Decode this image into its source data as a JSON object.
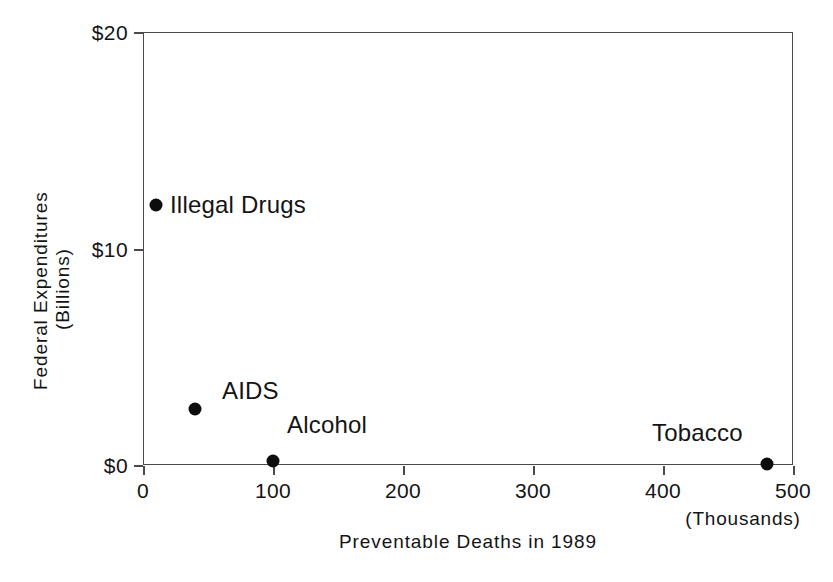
{
  "chart_data": {
    "type": "scatter",
    "title": "",
    "xlabel": "Preventable Deaths in 1989",
    "xunits": "(Thousands)",
    "ylabel": "Federal Expenditures",
    "yunits": "(Billions)",
    "xlim": [
      0,
      500
    ],
    "ylim": [
      0,
      20
    ],
    "grid": false,
    "legend": "none",
    "xticks": [
      0,
      100,
      200,
      300,
      400,
      500
    ],
    "xticklabels": [
      "0",
      "100",
      "200",
      "300",
      "400",
      "500"
    ],
    "yticks": [
      0,
      10,
      20
    ],
    "yticklabels": [
      "$0",
      "$10",
      "$20"
    ],
    "points": [
      {
        "label": "Illegal Drugs",
        "x": 10,
        "y": 12.0,
        "label_dx": 14,
        "label_dy": -14
      },
      {
        "label": "AIDS",
        "x": 40,
        "y": 2.6,
        "label_dx": 27,
        "label_dy": -32
      },
      {
        "label": "Alcohol",
        "x": 100,
        "y": 0.2,
        "label_dx": 14,
        "label_dy": -50
      },
      {
        "label": "Tobacco",
        "x": 480,
        "y": 0.05,
        "label_dx": -115,
        "label_dy": -45
      }
    ]
  },
  "axis": {
    "y_title": "Federal Expenditures",
    "y_units": "(Billions)",
    "x_title": "Preventable Deaths in 1989",
    "x_units": "(Thousands)",
    "x_labels": [
      "0",
      "100",
      "200",
      "300",
      "400",
      "500"
    ],
    "y_labels": [
      "$20",
      "$10",
      "$0"
    ]
  },
  "points": {
    "illegal_drugs": "Illegal Drugs",
    "aids": "AIDS",
    "alcohol": "Alcohol",
    "tobacco": "Tobacco"
  },
  "clipped_title": "      ",
  "colors": {
    "marker": "#0d0d0d",
    "frame": "#4a4a4a",
    "text": "#141414",
    "background": "#ffffff"
  }
}
